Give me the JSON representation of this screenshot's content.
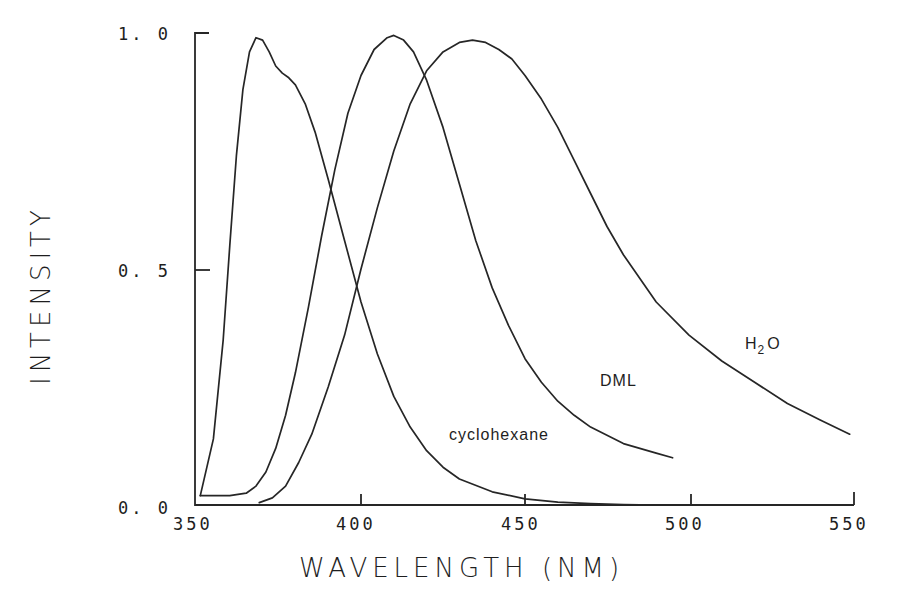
{
  "chart_data": {
    "type": "line",
    "title": "",
    "xlabel": "WAVELENGTH (NM)",
    "ylabel": "INTENSITY",
    "xlim": [
      350,
      550
    ],
    "ylim": [
      0.0,
      1.0
    ],
    "grid": false,
    "legend": "inline labels on curves",
    "x_ticks": [
      350,
      400,
      450,
      500,
      550
    ],
    "x_tick_labels": [
      "350",
      "400",
      "450",
      "500",
      "550"
    ],
    "y_ticks": [
      0.0,
      0.5,
      1.0
    ],
    "y_tick_labels": [
      "0. 0",
      "0. 5",
      "1. 0"
    ],
    "series": [
      {
        "name": "cyclohexane",
        "label": "cyclohexane",
        "label_pos": [
          446,
          0.155
        ],
        "x": [
          351,
          355,
          358,
          360,
          362,
          364,
          366,
          368,
          370,
          372,
          374,
          376,
          378,
          380,
          383,
          386,
          390,
          395,
          400,
          405,
          410,
          415,
          420,
          425,
          430,
          440,
          450,
          460,
          470,
          480,
          490,
          500
        ],
        "y": [
          0.02,
          0.14,
          0.35,
          0.55,
          0.74,
          0.88,
          0.96,
          0.99,
          0.985,
          0.96,
          0.93,
          0.915,
          0.905,
          0.89,
          0.85,
          0.79,
          0.69,
          0.56,
          0.43,
          0.32,
          0.23,
          0.165,
          0.115,
          0.08,
          0.055,
          0.028,
          0.013,
          0.006,
          0.003,
          0.001,
          0.0,
          0.0
        ]
      },
      {
        "name": "DML",
        "label": "DML",
        "label_pos": [
          477,
          0.26
        ],
        "x": [
          351,
          355,
          360,
          365,
          368,
          371,
          374,
          377,
          380,
          384,
          388,
          392,
          396,
          400,
          404,
          408,
          410,
          413,
          416,
          420,
          425,
          430,
          435,
          440,
          445,
          450,
          455,
          460,
          465,
          470,
          480,
          490,
          495
        ],
        "y": [
          0.02,
          0.02,
          0.02,
          0.025,
          0.04,
          0.07,
          0.12,
          0.19,
          0.28,
          0.42,
          0.57,
          0.71,
          0.83,
          0.91,
          0.965,
          0.99,
          0.995,
          0.985,
          0.96,
          0.9,
          0.8,
          0.68,
          0.56,
          0.46,
          0.38,
          0.31,
          0.26,
          0.22,
          0.19,
          0.165,
          0.13,
          0.11,
          0.1
        ]
      },
      {
        "name": "H2O",
        "label": "H",
        "label_sub": "2",
        "label_suffix": "O",
        "label_pos": [
          518,
          0.355
        ],
        "x": [
          369,
          373,
          377,
          381,
          385,
          390,
          395,
          400,
          405,
          410,
          415,
          420,
          425,
          430,
          434,
          438,
          442,
          446,
          450,
          455,
          460,
          465,
          470,
          475,
          480,
          490,
          500,
          510,
          520,
          530,
          540,
          549
        ],
        "y": [
          0.005,
          0.015,
          0.04,
          0.09,
          0.15,
          0.25,
          0.36,
          0.5,
          0.63,
          0.75,
          0.85,
          0.92,
          0.96,
          0.98,
          0.985,
          0.98,
          0.965,
          0.945,
          0.91,
          0.86,
          0.8,
          0.73,
          0.66,
          0.59,
          0.53,
          0.43,
          0.36,
          0.305,
          0.26,
          0.215,
          0.18,
          0.15
        ]
      }
    ]
  },
  "axes": {
    "x_title": "WAVELENGTH (NM)",
    "y_title": "INTENSITY"
  }
}
